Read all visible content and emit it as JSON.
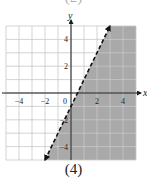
{
  "figure": {
    "label": "(4)",
    "top_fragment_label": "(2)"
  },
  "chart_data": {
    "type": "line",
    "title": "",
    "xlabel": "x",
    "ylabel": "y",
    "xlim": [
      -5,
      5
    ],
    "ylim": [
      -5,
      5
    ],
    "grid": true,
    "x_ticks": [
      -4,
      -2,
      0,
      2,
      4
    ],
    "y_ticks": [
      -4,
      -2,
      2,
      4
    ],
    "x_tick_labels": [
      "-4",
      "-2",
      "0",
      "2",
      "4"
    ],
    "y_tick_labels": [
      "-4",
      "-2",
      "2",
      "4"
    ],
    "series": [
      {
        "name": "boundary y = 2x - 1",
        "style": "dashed",
        "arrows": "both",
        "points": [
          [
            -2,
            -5
          ],
          [
            3,
            5
          ]
        ]
      }
    ],
    "shaded_region": {
      "inequality": "y < 2x - 1",
      "side": "below-right of line",
      "color": "#a9a9a9"
    }
  },
  "colors": {
    "shade": "#a9a9a9",
    "grid": "#c8c8c8",
    "axis": "#1a1a1a",
    "line": "#111111"
  }
}
